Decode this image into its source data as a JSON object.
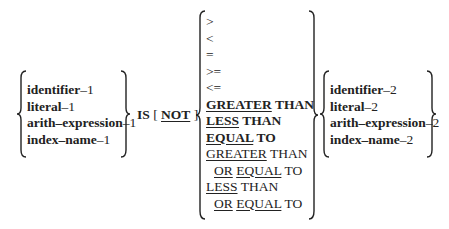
{
  "syntax_diagram": {
    "left_operands": [
      {
        "word": "identifier",
        "suffix": "–1"
      },
      {
        "word": "literal",
        "suffix": "–1"
      },
      {
        "word": "arith–expression",
        "suffix": "–1"
      },
      {
        "word": "index–name",
        "suffix": "–1"
      }
    ],
    "is_keyword": "IS",
    "optional_open": "[",
    "not_keyword": "NOT",
    "optional_close": "]",
    "relational_operators": {
      "gt": ">",
      "lt": "<",
      "eq": "=",
      "ge": ">=",
      "le": "<=",
      "greater_than": {
        "kw": "GREATER",
        "rest": " THAN"
      },
      "less_than": {
        "kw": "LESS",
        "rest": " THAN"
      },
      "equal_to": {
        "kw": "EQUAL",
        "rest": " TO"
      },
      "greater_than_or_equal": {
        "kw": "GREATER",
        "rest": " THAN",
        "or": "OR",
        "eq": "EQUAL",
        "to": " TO"
      },
      "less_than_or_equal": {
        "kw": "LESS",
        "rest": " THAN",
        "or": "OR",
        "eq": "EQUAL",
        "to": " TO"
      }
    },
    "right_operands": [
      {
        "word": "identifier",
        "suffix": "–2"
      },
      {
        "word": "literal",
        "suffix": "–2"
      },
      {
        "word": "arith–expression",
        "suffix": "–2"
      },
      {
        "word": "index–name",
        "suffix": "–2"
      }
    ]
  }
}
